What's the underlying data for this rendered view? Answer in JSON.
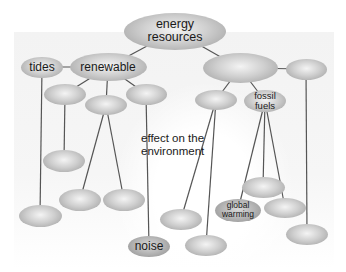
{
  "diagram": {
    "type": "concept-map",
    "colors": {
      "node_fill": "#c4c4c4",
      "link": "#555555",
      "text": "#1a1a1a"
    },
    "nodes": [
      {
        "id": "energy",
        "label": "energy\nresources",
        "cx": 175,
        "cy": 31,
        "w": 102,
        "h": 37,
        "size": "lg"
      },
      {
        "id": "renewable",
        "label": "renewable",
        "cx": 108,
        "cy": 67,
        "w": 77,
        "h": 28,
        "size": "md"
      },
      {
        "id": "tides",
        "label": "tides",
        "cx": 42,
        "cy": 67,
        "w": 42,
        "h": 21,
        "size": "md"
      },
      {
        "id": "nonrenewable",
        "label": "",
        "cx": 240,
        "cy": 68,
        "w": 75,
        "h": 30
      },
      {
        "id": "right-branch",
        "label": "",
        "cx": 306,
        "cy": 69,
        "w": 41,
        "h": 21
      },
      {
        "id": "ren-child-1",
        "label": "",
        "cx": 65,
        "cy": 94,
        "w": 42,
        "h": 21
      },
      {
        "id": "ren-child-2",
        "label": "",
        "cx": 106,
        "cy": 105,
        "w": 42,
        "h": 20
      },
      {
        "id": "ren-child-3",
        "label": "",
        "cx": 146,
        "cy": 94,
        "w": 41,
        "h": 21
      },
      {
        "id": "nonren-child-1",
        "label": "",
        "cx": 216,
        "cy": 100,
        "w": 42,
        "h": 20
      },
      {
        "id": "fossil",
        "label": "fossil\nfuels",
        "cx": 265,
        "cy": 101,
        "w": 42,
        "h": 22,
        "size": "fs"
      },
      {
        "id": "leaf-a",
        "label": "",
        "cx": 64,
        "cy": 161,
        "w": 42,
        "h": 22
      },
      {
        "id": "leaf-b",
        "label": "",
        "cx": 80,
        "cy": 200,
        "w": 42,
        "h": 22
      },
      {
        "id": "leaf-c",
        "label": "",
        "cx": 124,
        "cy": 200,
        "w": 42,
        "h": 22
      },
      {
        "id": "leaf-d",
        "label": "",
        "cx": 40,
        "cy": 216,
        "w": 43,
        "h": 22
      },
      {
        "id": "noise",
        "label": "noise",
        "cx": 149,
        "cy": 246,
        "w": 42,
        "h": 21,
        "size": "md",
        "dark": true
      },
      {
        "id": "leaf-e",
        "label": "",
        "cx": 263,
        "cy": 187,
        "w": 43,
        "h": 21
      },
      {
        "id": "global-warming",
        "label": "global\nwarming",
        "cx": 238,
        "cy": 210,
        "w": 46,
        "h": 23,
        "size": "sm",
        "dark": true
      },
      {
        "id": "leaf-f",
        "label": "",
        "cx": 285,
        "cy": 208,
        "w": 42,
        "h": 20
      },
      {
        "id": "leaf-g",
        "label": "",
        "cx": 307,
        "cy": 234,
        "w": 42,
        "h": 21
      },
      {
        "id": "leaf-h",
        "label": "",
        "cx": 181,
        "cy": 219,
        "w": 42,
        "h": 21
      },
      {
        "id": "leaf-i",
        "label": "",
        "cx": 206,
        "cy": 245,
        "w": 42,
        "h": 21
      }
    ],
    "links": [
      [
        "energy",
        "renewable"
      ],
      [
        "energy",
        "nonrenewable"
      ],
      [
        "renewable",
        "tides"
      ],
      [
        "renewable",
        "ren-child-1"
      ],
      [
        "renewable",
        "ren-child-2"
      ],
      [
        "renewable",
        "ren-child-3"
      ],
      [
        "nonrenewable",
        "right-branch"
      ],
      [
        "nonrenewable",
        "nonren-child-1"
      ],
      [
        "nonrenewable",
        "fossil"
      ],
      [
        "tides",
        "leaf-d"
      ],
      [
        "ren-child-1",
        "leaf-a"
      ],
      [
        "ren-child-2",
        "leaf-b"
      ],
      [
        "ren-child-2",
        "leaf-c"
      ],
      [
        "ren-child-3",
        "noise"
      ],
      [
        "nonren-child-1",
        "leaf-h"
      ],
      [
        "nonren-child-1",
        "leaf-i"
      ],
      [
        "fossil",
        "global-warming"
      ],
      [
        "fossil",
        "leaf-e"
      ],
      [
        "fossil",
        "leaf-f"
      ],
      [
        "right-branch",
        "leaf-g"
      ]
    ],
    "annotation": {
      "text": "effect on the\nenvironment",
      "x": 141,
      "y": 132
    }
  }
}
